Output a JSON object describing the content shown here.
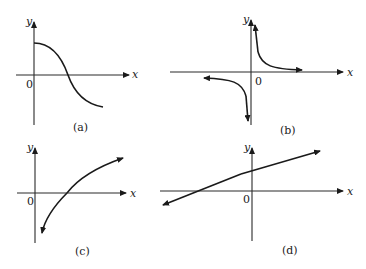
{
  "panels": [
    {
      "id": "a",
      "caption": "(a)",
      "x_label": "x",
      "y_label": "y",
      "origin_label": "0",
      "description": "decreasing S-shaped curve crossing positive x-axis"
    },
    {
      "id": "b",
      "caption": "(b)",
      "x_label": "x",
      "y_label": "y",
      "origin_label": "0",
      "description": "hyperbola y = k/x with branches in quadrants I and III"
    },
    {
      "id": "c",
      "caption": "(c)",
      "x_label": "x",
      "y_label": "y",
      "origin_label": "0",
      "description": "increasing logarithmic-type curve crossing positive x-axis"
    },
    {
      "id": "d",
      "caption": "(d)",
      "x_label": "x",
      "y_label": "y",
      "origin_label": "0",
      "description": "straight line with positive slope and positive y-intercept"
    }
  ]
}
